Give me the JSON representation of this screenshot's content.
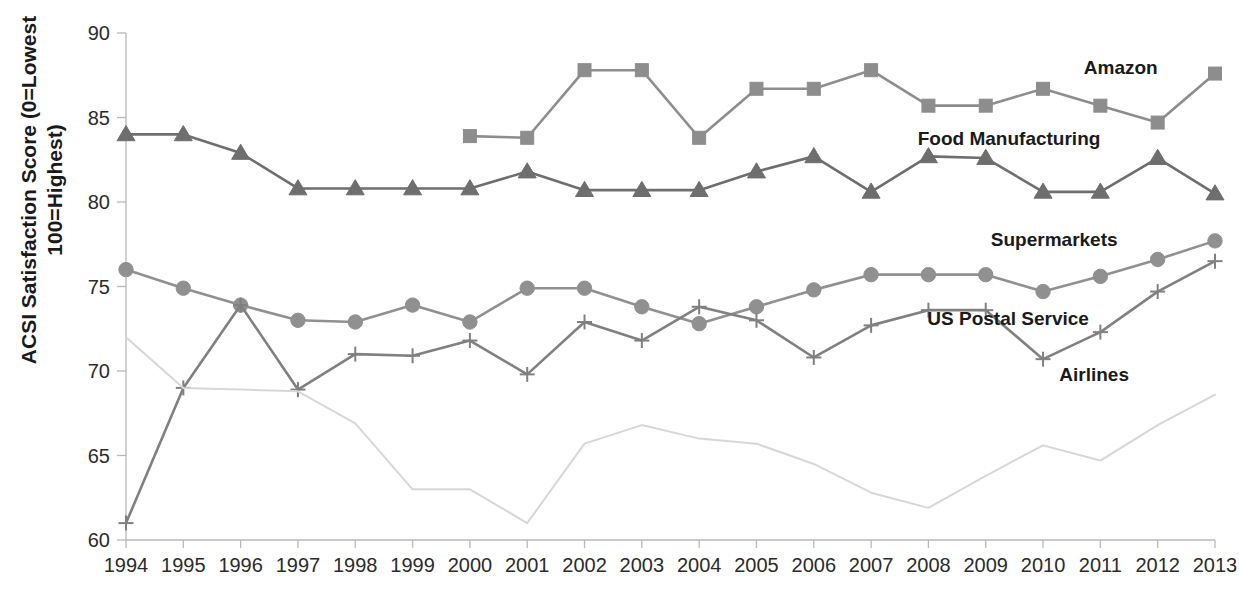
{
  "chart_data": {
    "type": "line",
    "title": "",
    "subtitle": "",
    "xlabel": "",
    "ylabel_line1": "ACSI Satisfaction Score (0=Lowest",
    "ylabel_line2": "100=Highest)",
    "ylabel": "ACSI Satisfaction Score (0=Lowest 100=Highest)",
    "grid": false,
    "legend_position": "right-inline-labels",
    "xlim": [
      1994,
      2013
    ],
    "ylim": [
      60,
      90
    ],
    "ytick_values": [
      60,
      65,
      70,
      75,
      80,
      85,
      90
    ],
    "ytick_labels": [
      "60",
      "65",
      "70",
      "75",
      "80",
      "85",
      "90"
    ],
    "categories": [
      1994,
      1995,
      1996,
      1997,
      1998,
      1999,
      2000,
      2001,
      2002,
      2003,
      2004,
      2005,
      2006,
      2007,
      2008,
      2009,
      2010,
      2011,
      2012,
      2013
    ],
    "xtick_labels": [
      "1994",
      "1995",
      "1996",
      "1997",
      "1998",
      "1999",
      "2000",
      "2001",
      "2002",
      "2003",
      "2004",
      "2005",
      "2006",
      "2007",
      "2008",
      "2009",
      "2010",
      "2011",
      "2012",
      "2013"
    ],
    "series": [
      {
        "name": "Amazon",
        "label": "Amazon",
        "marker": "square",
        "color": "#8d8d8d",
        "label_x": 2012.0,
        "label_y": 87.6,
        "values": [
          null,
          null,
          null,
          null,
          null,
          null,
          83.9,
          83.8,
          87.8,
          87.8,
          83.8,
          86.7,
          86.7,
          87.8,
          85.7,
          85.7,
          86.7,
          85.7,
          84.7,
          87.6
        ]
      },
      {
        "name": "Food Manufacturing",
        "label": "Food Manufacturing",
        "marker": "triangle",
        "color": "#6e6e6e",
        "label_x": 2011.0,
        "label_y": 83.4,
        "values": [
          84.0,
          84.0,
          82.9,
          80.8,
          80.8,
          80.8,
          80.8,
          81.8,
          80.7,
          80.7,
          80.7,
          81.8,
          82.7,
          80.6,
          82.7,
          82.6,
          80.6,
          80.6,
          82.6,
          80.5
        ]
      },
      {
        "name": "Supermarkets",
        "label": "Supermarkets",
        "marker": "circle",
        "color": "#909090",
        "label_x": 2011.3,
        "label_y": 77.4,
        "values": [
          76.0,
          74.9,
          73.9,
          73.0,
          72.9,
          73.9,
          72.9,
          74.9,
          74.9,
          73.8,
          72.8,
          73.8,
          74.8,
          75.7,
          75.7,
          75.7,
          74.7,
          75.6,
          76.6,
          77.7
        ]
      },
      {
        "name": "US Postal Service",
        "label": "US Postal Service",
        "marker": "plus",
        "color": "#808080",
        "label_x": 2010.8,
        "label_y": 72.7,
        "values": [
          61.0,
          69.0,
          73.9,
          68.9,
          71.0,
          70.9,
          71.8,
          69.8,
          72.9,
          71.8,
          73.8,
          73.0,
          70.8,
          72.7,
          73.6,
          73.6,
          70.7,
          72.3,
          74.7,
          76.5
        ]
      },
      {
        "name": "Airlines",
        "label": "Airlines",
        "marker": "none",
        "color": "#d7d7d7",
        "label_x": 2011.5,
        "label_y": 69.4,
        "values": [
          72.0,
          69.0,
          68.9,
          68.8,
          66.9,
          63.0,
          63.0,
          61.0,
          65.7,
          66.8,
          66.0,
          65.7,
          64.5,
          62.8,
          61.9,
          63.8,
          65.6,
          64.7,
          66.8,
          68.6
        ]
      }
    ]
  }
}
